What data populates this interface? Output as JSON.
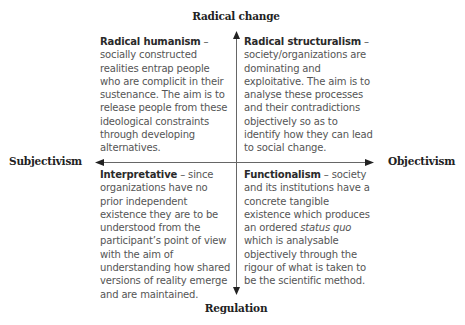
{
  "axes": {
    "top": "Radical change",
    "bottom": "Regulation",
    "left": "Subjectivism",
    "right": "Objectivism"
  },
  "quadrants": {
    "top_left": {
      "title": "Radical humanism",
      "sep": " – ",
      "text": "socially constructed realities entrap people who are complicit in their sustenance. The aim is to release people from these ideological constraints through developing alternatives."
    },
    "top_right": {
      "title": "Radical structuralism",
      "sep": " – ",
      "text": "society/organizations are dominating and exploitative. The aim is to analyse these processes and their contradictions objectively so as to identify how they can lead to social change."
    },
    "bottom_left": {
      "title": "Interpretative",
      "sep": " – ",
      "text": "since organizations have no prior independent existence they are to be understood from the participant’s point of view with the aim of understanding how shared versions of reality emerge and are maintained."
    },
    "bottom_right": {
      "title": "Functionalism",
      "sep": " – ",
      "text_before": "society and its institutions have a concrete tangible existence which produces an ordered ",
      "text_italic": "status quo",
      "text_after": " which is analysable objectively through the rigour of what is taken to be the scientific method."
    }
  },
  "colors": {
    "axis_line": "#555555",
    "text": "#555555",
    "heading": "#222222"
  }
}
